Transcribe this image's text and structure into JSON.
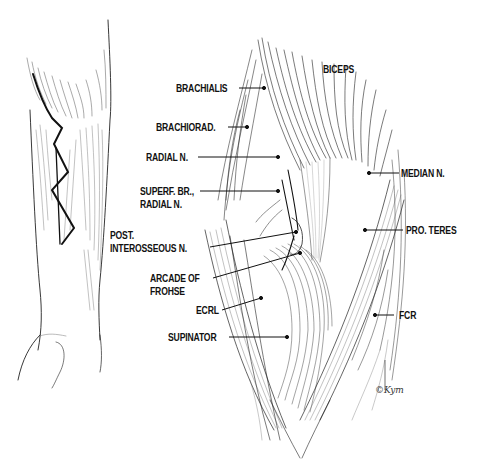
{
  "figure": {
    "left_panel": {
      "description": "Forearm with zig-zag incision"
    },
    "right_panel": {
      "description": "Anterior elbow dissection showing radial nerve and arcade of Frohse"
    },
    "labels": [
      {
        "id": "biceps",
        "text": "BICEPS"
      },
      {
        "id": "brachialis",
        "text": "BRACHIALIS"
      },
      {
        "id": "brachiorad",
        "text": "BRACHIORAD."
      },
      {
        "id": "radial_n",
        "text": "RADIAL N."
      },
      {
        "id": "superf_br_1",
        "text": "SUPERF. BR.,"
      },
      {
        "id": "superf_br_2",
        "text": "RADIAL N."
      },
      {
        "id": "post_int_1",
        "text": "POST."
      },
      {
        "id": "post_int_2",
        "text": "INTEROSSEOUS N."
      },
      {
        "id": "arcade_1",
        "text": "ARCADE OF"
      },
      {
        "id": "arcade_2",
        "text": "FROHSE"
      },
      {
        "id": "ecrl",
        "text": "ECRL"
      },
      {
        "id": "supinator",
        "text": "SUPINATOR"
      },
      {
        "id": "median_n",
        "text": "MEDIAN N."
      },
      {
        "id": "pro_teres",
        "text": "PRO. TERES"
      },
      {
        "id": "fcr",
        "text": "FCR"
      }
    ],
    "signature": "©Kym"
  }
}
